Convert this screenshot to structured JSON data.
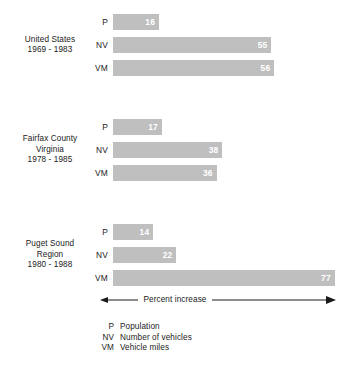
{
  "chart_data": {
    "type": "bar",
    "orientation": "horizontal",
    "title": "",
    "xlabel": "Percent increase",
    "ylabel": "",
    "xlim": [
      0,
      80
    ],
    "grid": false,
    "legend_position": "bottom",
    "categories": [
      "P",
      "NV",
      "VM"
    ],
    "series_names": [
      "Population",
      "Number of vehicles",
      "Vehicle miles"
    ],
    "groups": [
      {
        "name": "United States",
        "label_lines": [
          "United States",
          "1969 - 1983"
        ],
        "bars": [
          {
            "key": "P",
            "value": 16
          },
          {
            "key": "NV",
            "value": 55
          },
          {
            "key": "VM",
            "value": 56
          }
        ]
      },
      {
        "name": "Fairfax County Virginia",
        "label_lines": [
          "Fairfax County",
          "Virginia",
          "1978 - 1985"
        ],
        "bars": [
          {
            "key": "P",
            "value": 17
          },
          {
            "key": "NV",
            "value": 38
          },
          {
            "key": "VM",
            "value": 36
          }
        ]
      },
      {
        "name": "Puget Sound Region",
        "label_lines": [
          "Puget Sound",
          "Region",
          "1980 - 1988"
        ],
        "bars": [
          {
            "key": "P",
            "value": 14
          },
          {
            "key": "NV",
            "value": 22
          },
          {
            "key": "VM",
            "value": 77
          }
        ]
      }
    ],
    "legend": [
      {
        "key": "P",
        "description": "Population"
      },
      {
        "key": "NV",
        "description": "Number of vehicles"
      },
      {
        "key": "VM",
        "description": "Vehicle miles"
      }
    ],
    "colors": {
      "bar": "#bfbfbf",
      "value_text": "#ffffff",
      "text": "#1a1a1a",
      "background": "#ffffff",
      "axis_line": "#1a1a1a"
    },
    "axis": {
      "caption": "Percent increase",
      "arrow_left": true,
      "arrow_right": true
    },
    "layout": {
      "bar_origin_x": 113,
      "px_per_unit": 2.88,
      "bar_height": 16,
      "bar_gap": 7,
      "group_tops": [
        14,
        119,
        224
      ]
    }
  }
}
